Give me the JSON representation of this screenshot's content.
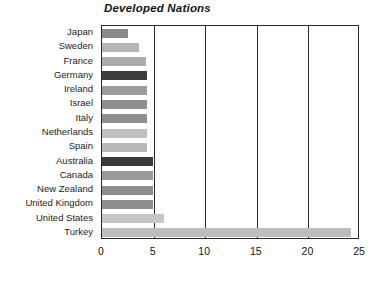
{
  "chart_data": {
    "type": "bar",
    "orientation": "horizontal",
    "title": "Developed Nations",
    "xlabel": "",
    "ylabel": "",
    "xlim": [
      0,
      25
    ],
    "xticks": [
      0,
      5,
      10,
      15,
      20,
      25
    ],
    "xtick_labels": [
      "0",
      "5",
      "10",
      "15",
      "20",
      "25"
    ],
    "grid": "vertical",
    "legend": "none",
    "categories": [
      "Japan",
      "Sweden",
      "France",
      "Germany",
      "Ireland",
      "Israel",
      "Italy",
      "Netherlands",
      "Spain",
      "Australia",
      "Canada",
      "New Zealand",
      "United Kingdom",
      "United States",
      "Turkey"
    ],
    "values": [
      2.5,
      3.6,
      4.3,
      4.4,
      4.4,
      4.4,
      4.4,
      4.4,
      4.4,
      4.9,
      4.9,
      4.9,
      4.9,
      6.0,
      24.1
    ],
    "bar_colors": [
      "#8a8a8a",
      "#b5b5b5",
      "#ababab",
      "#3d3d3d",
      "#9d9d9d",
      "#8f8f8f",
      "#8f8f8f",
      "#c0c0c0",
      "#b8b8b8",
      "#3a3a3a",
      "#9a9a9a",
      "#8d8d8d",
      "#8d8d8d",
      "#c6c6c6",
      "#bdbdbd"
    ]
  },
  "colors": {
    "background": "#ffffff",
    "axis": "#2a2a2a",
    "text": "#1a1a1a"
  }
}
